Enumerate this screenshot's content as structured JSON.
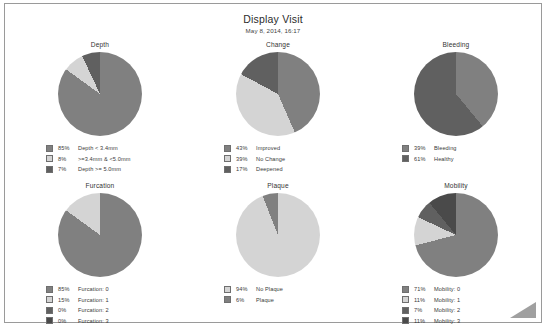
{
  "header": {
    "title": "Display Visit",
    "date": "May 8, 2014, 16:17"
  },
  "colors": {
    "slice_a": "#808080",
    "slice_b": "#d4d4d4",
    "slice_c": "#606060",
    "slice_d": "#4a4a4a",
    "frame": "#9a9a9a",
    "text": "#3a3a3a"
  },
  "charts": [
    {
      "id": "depth",
      "title": "Depth",
      "chart_data": {
        "type": "pie",
        "title": "Depth",
        "categories": [
          "Depth < 3.4mm",
          ">=3.4mm & <5.0mm",
          "Depth >= 5.0mm"
        ],
        "values": [
          85,
          8,
          7
        ],
        "unit": "%",
        "colors": [
          "#808080",
          "#d4d4d4",
          "#606060"
        ],
        "legend_position": "bottom-left",
        "start_angle": 0
      },
      "legend": [
        {
          "pct": "85%",
          "label": "Depth < 3.4mm",
          "color": "#808080"
        },
        {
          "pct": "8%",
          "label": ">=3.4mm & <5.0mm",
          "color": "#d4d4d4"
        },
        {
          "pct": "7%",
          "label": "Depth >= 5.0mm",
          "color": "#606060"
        }
      ]
    },
    {
      "id": "change",
      "title": "Change",
      "chart_data": {
        "type": "pie",
        "title": "Change",
        "categories": [
          "Improved",
          "No Change",
          "Deepened"
        ],
        "values": [
          43,
          39,
          17
        ],
        "unit": "%",
        "colors": [
          "#808080",
          "#d4d4d4",
          "#606060"
        ],
        "legend_position": "bottom-left",
        "start_angle": 0
      },
      "legend": [
        {
          "pct": "43%",
          "label": "Improved",
          "color": "#808080"
        },
        {
          "pct": "39%",
          "label": "No Change",
          "color": "#d4d4d4"
        },
        {
          "pct": "17%",
          "label": "Deepened",
          "color": "#606060"
        }
      ]
    },
    {
      "id": "bleeding",
      "title": "Bleeding",
      "chart_data": {
        "type": "pie",
        "title": "Bleeding",
        "categories": [
          "Bleeding",
          "Healthy"
        ],
        "values": [
          39,
          61
        ],
        "unit": "%",
        "colors": [
          "#808080",
          "#606060"
        ],
        "legend_position": "bottom-left",
        "start_angle": 0
      },
      "legend": [
        {
          "pct": "39%",
          "label": "Bleeding",
          "color": "#808080"
        },
        {
          "pct": "61%",
          "label": "Healthy",
          "color": "#606060"
        }
      ]
    },
    {
      "id": "furcation",
      "title": "Furcation",
      "chart_data": {
        "type": "pie",
        "title": "Furcation",
        "categories": [
          "Furcation: 0",
          "Furcation: 1",
          "Furcation: 2",
          "Furcation: 3"
        ],
        "values": [
          85,
          15,
          0,
          0
        ],
        "unit": "%",
        "colors": [
          "#808080",
          "#d4d4d4",
          "#606060",
          "#4a4a4a"
        ],
        "legend_position": "bottom-left",
        "start_angle": 0
      },
      "legend": [
        {
          "pct": "85%",
          "label": "Furcation: 0",
          "color": "#808080"
        },
        {
          "pct": "15%",
          "label": "Furcation: 1",
          "color": "#d4d4d4"
        },
        {
          "pct": "0%",
          "label": "Furcation: 2",
          "color": "#606060"
        },
        {
          "pct": "0%",
          "label": "Furcation: 3",
          "color": "#4a4a4a"
        }
      ]
    },
    {
      "id": "plaque",
      "title": "Plaque",
      "chart_data": {
        "type": "pie",
        "title": "Plaque",
        "categories": [
          "No Plaque",
          "Plaque"
        ],
        "values": [
          94,
          6
        ],
        "unit": "%",
        "colors": [
          "#d4d4d4",
          "#808080"
        ],
        "legend_position": "bottom-left",
        "start_angle": 0
      },
      "legend": [
        {
          "pct": "94%",
          "label": "No Plaque",
          "color": "#d4d4d4"
        },
        {
          "pct": "6%",
          "label": "Plaque",
          "color": "#808080"
        }
      ]
    },
    {
      "id": "mobility",
      "title": "Mobility",
      "chart_data": {
        "type": "pie",
        "title": "Mobility",
        "categories": [
          "Mobility: 0",
          "Mobility: 1",
          "Mobility: 2",
          "Mobility: 3"
        ],
        "values": [
          71,
          11,
          7,
          11
        ],
        "unit": "%",
        "colors": [
          "#808080",
          "#d4d4d4",
          "#606060",
          "#4a4a4a"
        ],
        "legend_position": "bottom-left",
        "start_angle": 0
      },
      "legend": [
        {
          "pct": "71%",
          "label": "Mobility: 0",
          "color": "#808080"
        },
        {
          "pct": "11%",
          "label": "Mobility: 1",
          "color": "#d4d4d4"
        },
        {
          "pct": "7%",
          "label": "Mobility: 2",
          "color": "#606060"
        },
        {
          "pct": "11%",
          "label": "Mobility: 3",
          "color": "#4a4a4a"
        }
      ]
    }
  ]
}
